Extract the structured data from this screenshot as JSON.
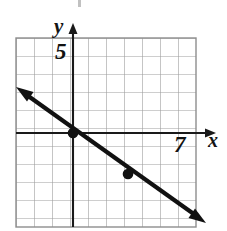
{
  "figure": {
    "kind": "coordinate-grid-line-graph",
    "labels": {
      "y_axis": "y",
      "x_axis": "x",
      "y_tick": "5",
      "x_tick": "7"
    },
    "colors": {
      "grid_line": "#9a9a9a",
      "grid_border": "#8a8a8a",
      "axis": "#1a1a1a",
      "plot_line": "#111111",
      "point": "#111111",
      "background": "#ffffff"
    },
    "grid": {
      "left_px": 16,
      "top_px": 38,
      "right_px": 196,
      "bottom_px": 227,
      "cell_px": 18,
      "cols": 10,
      "rows": 10.5
    },
    "axes": {
      "origin_px": [
        73,
        133
      ],
      "x_axis_y_px": 133,
      "y_axis_x_px": 73,
      "x_axis_arrow_tip_px": [
        216,
        133
      ],
      "y_axis_arrow_tip_px": [
        73,
        24
      ],
      "x_tick_value": 7,
      "y_tick_value": 5
    },
    "plot_line": {
      "slope": -0.75,
      "intercept": 0,
      "equation": "y = -3/4 x",
      "start_arrow_px": [
        17,
        88
      ],
      "end_arrow_px": [
        205,
        222
      ],
      "double_arrow": true,
      "stroke_width_px": 4
    },
    "points": [
      {
        "label": "origin-point",
        "px": [
          73,
          133
        ],
        "data": [
          0,
          0
        ]
      },
      {
        "label": "second-point",
        "px": [
          128,
          174
        ],
        "data": [
          3,
          -2.25
        ]
      }
    ]
  }
}
